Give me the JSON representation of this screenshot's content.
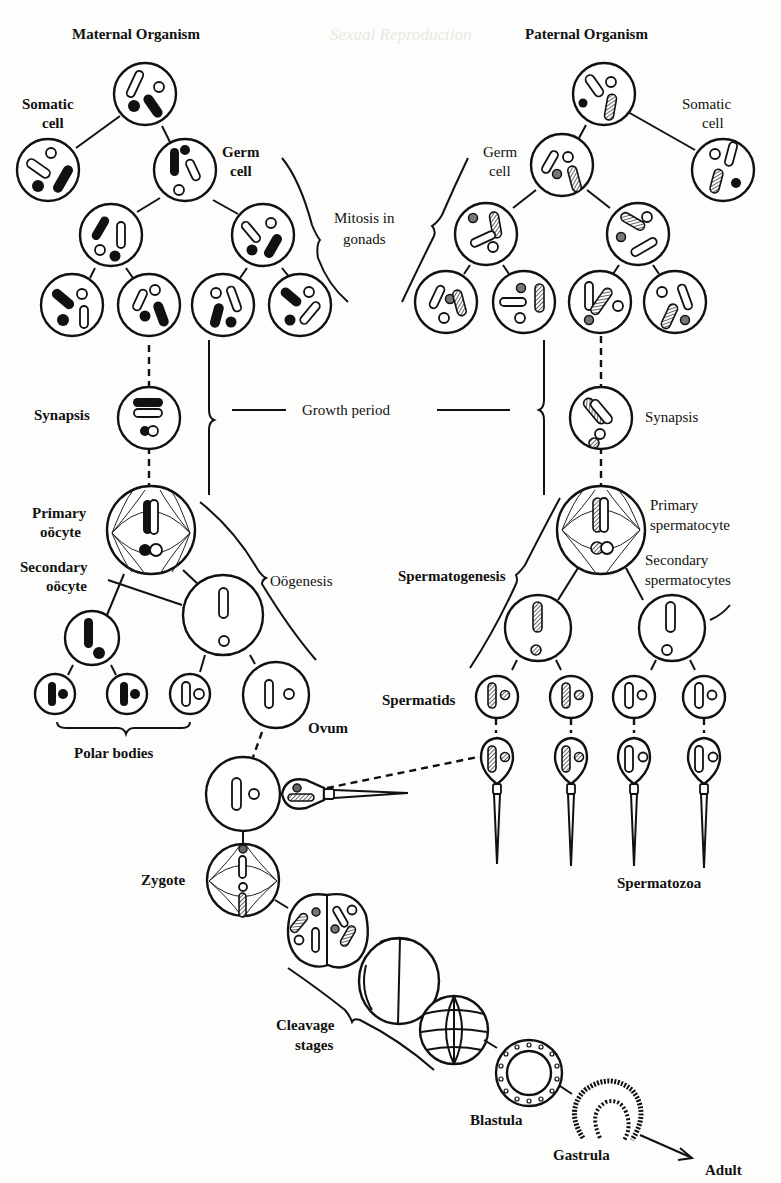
{
  "ghost_header": "Sexual Reproduction",
  "labels": {
    "maternal_title": "Maternal Organism",
    "paternal_title": "Paternal Organism",
    "somatic_cell_left_1": "Somatic",
    "somatic_cell_left_2": "cell",
    "germ_cell_left_1": "Germ",
    "germ_cell_left_2": "cell",
    "somatic_cell_right_1": "Somatic",
    "somatic_cell_right_2": "cell",
    "germ_cell_right_1": "Germ",
    "germ_cell_right_2": "cell",
    "mitosis_1": "Mitosis in",
    "mitosis_2": "gonads",
    "synapsis_left": "Synapsis",
    "synapsis_right": "Synapsis",
    "growth_period": "Growth period",
    "primary_oocyte_1": "Primary",
    "primary_oocyte_2": "oöcyte",
    "secondary_oocyte_1": "Secondary",
    "secondary_oocyte_2": "oöcyte",
    "oogenesis": "Oögenesis",
    "primary_spermatocyte_1": "Primary",
    "primary_spermatocyte_2": "spermatocyte",
    "secondary_spermatocytes_1": "Secondary",
    "secondary_spermatocytes_2": "spermatocytes",
    "spermatogenesis": "Spermatogenesis",
    "spermatids": "Spermatids",
    "polar_bodies": "Polar bodies",
    "ovum": "Ovum",
    "zygote": "Zygote",
    "spermatozoa": "Spermatozoa",
    "cleavage_1": "Cleavage",
    "cleavage_2": "stages",
    "blastula": "Blastula",
    "gastrula": "Gastrula",
    "adult": "Adult"
  },
  "legend": {
    "maternal_chromosome": "solid black",
    "paternal_chromosome": "hatched",
    "colors": {
      "ink": "#111111",
      "paper": "#fdfdfb"
    }
  }
}
